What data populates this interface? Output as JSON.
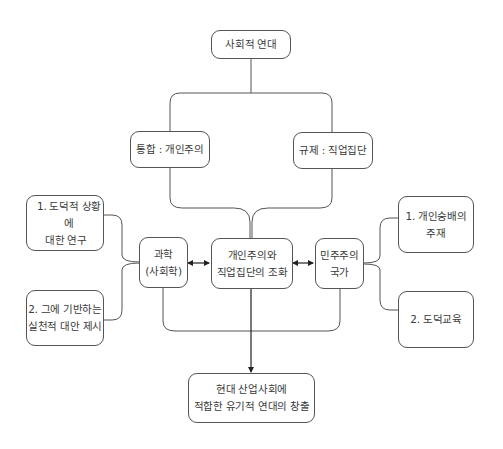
{
  "diagram": {
    "root": {
      "label": "사회적 연대"
    },
    "branches": [
      {
        "label": "통합 : 개인주의"
      },
      {
        "label": "규제 : 직업집단"
      }
    ],
    "center": {
      "line1": "개인주의와",
      "line2": "직업집단의 조화"
    },
    "left_node": {
      "line1": "과학",
      "line2": "(사회학)"
    },
    "right_node": {
      "line1": "민주주의",
      "line2": "국가"
    },
    "left_items": [
      {
        "line1": "1.  도덕적 상황에",
        "line2": "대한 연구"
      },
      {
        "line1": "2. 그에 기반하는",
        "line2": "실천적 대안 제시"
      }
    ],
    "right_items": [
      {
        "line1": "1.  개인숭배의",
        "line2": "주재"
      },
      {
        "line1": "2. 도덕교육",
        "line2": ""
      }
    ],
    "result": {
      "line1": "현대 산업사회에",
      "line2": "적합한 유기적 연대의 창출"
    },
    "colors": {
      "stroke": "#555555",
      "text": "#3a3a3a",
      "background": "#ffffff"
    }
  }
}
